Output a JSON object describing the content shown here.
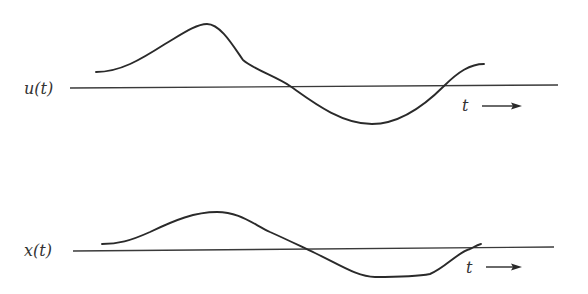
{
  "diagram": {
    "type": "signal-waveform-comparison",
    "panels": [
      {
        "id": "input",
        "signal_label": "u(t)",
        "time_label": "t",
        "time_direction": "right",
        "axis": {
          "x1": 70,
          "y1": 88,
          "x2": 558,
          "y2": 85
        },
        "curve_path": "M96,72 C120,72 140,60 165,44 C185,32 197,24 207,24 C220,24 232,44 243,60 C255,70 275,76 290,86 C310,100 340,124 372,124 C400,124 425,105 444,86 C458,72 470,64 484,64",
        "label_pos": {
          "x": 24,
          "y": 94
        },
        "t_pos": {
          "x": 462,
          "y": 111
        },
        "arrow": {
          "x1": 482,
          "y1": 106,
          "x2": 522,
          "y2": 106
        }
      },
      {
        "id": "output",
        "signal_label": "x(t)",
        "time_label": "t",
        "time_direction": "right",
        "axis": {
          "x1": 73,
          "y1": 251,
          "x2": 554,
          "y2": 247
        },
        "curve_path": "M102,244 C118,244 130,241 150,232 C175,220 195,212 217,212 C238,212 250,222 270,232 C288,240 300,246 315,253 C340,265 358,277 375,277 C395,277 420,276 430,274 C445,268 458,252 470,249 C474,247 477,245 481,244",
        "label_pos": {
          "x": 24,
          "y": 256
        },
        "t_pos": {
          "x": 466,
          "y": 273
        },
        "arrow": {
          "x1": 486,
          "y1": 267,
          "x2": 522,
          "y2": 267
        }
      }
    ],
    "colors": {
      "stroke": "#2a2a2a",
      "axis": "#3a3a3a",
      "text": "#333333",
      "background": "#ffffff"
    }
  }
}
